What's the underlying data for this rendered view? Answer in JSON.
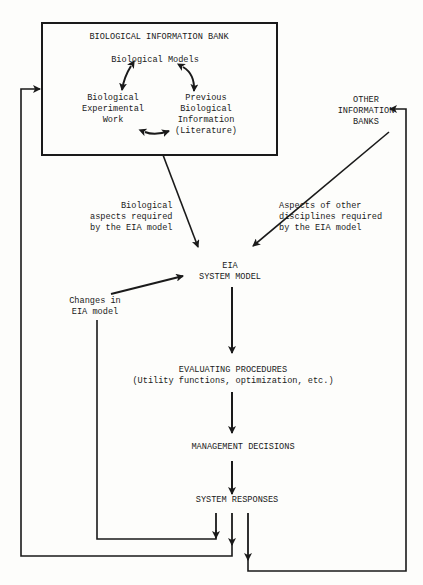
{
  "diagram": {
    "bank": {
      "title": "BIOLOGICAL INFORMATION BANK",
      "models": "Biological Models",
      "experimental": "Biological\nExperimental\nWork",
      "previous": "Previous\nBiological\nInformation\n(Literature)"
    },
    "other_banks": "OTHER\nINFORMATION\nBANKS",
    "bio_aspects": "Biological\naspects required\nby the EIA model",
    "other_aspects": "Aspects of other\ndisciplines required\nby the EIA model",
    "eia_model": "EIA\nSYSTEM MODEL",
    "changes": "Changes in\nEIA model",
    "evaluating": "EVALUATING PROCEDURES\n(Utility functions, optimization, etc.)",
    "management": "MANAGEMENT DECISIONS",
    "responses": "SYSTEM RESPONSES"
  },
  "colors": {
    "ink": "#1a1a1a",
    "background": "#fdfdfb"
  }
}
